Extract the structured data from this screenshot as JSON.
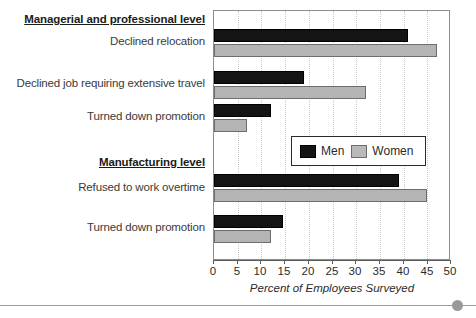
{
  "chart_data": {
    "type": "bar",
    "orientation": "horizontal",
    "title": "",
    "xlabel": "Percent of Employees Surveyed",
    "ylabel": "",
    "xlim": [
      0,
      50
    ],
    "xticks": [
      "0",
      "5",
      "10",
      "15",
      "20",
      "25",
      "30",
      "35",
      "40",
      "45",
      "50"
    ],
    "grid": true,
    "legend_position": "middle-right",
    "groups": [
      {
        "heading": "Managerial and professional level",
        "categories": [
          "Declined relocation",
          "Declined job requiring extensive travel",
          "Turned down promotion"
        ],
        "men": [
          41,
          19,
          12
        ],
        "women": [
          47,
          32,
          7
        ]
      },
      {
        "heading": "Manufacturing level",
        "categories": [
          "Refused to work overtime",
          "Turned down promotion"
        ],
        "men": [
          39,
          14.5
        ],
        "women": [
          45,
          12
        ]
      }
    ],
    "series": [
      {
        "name": "Men",
        "color": "#141414",
        "values": [
          41,
          19,
          12,
          39,
          14.5
        ]
      },
      {
        "name": "Women",
        "color": "#b4b4b4",
        "values": [
          47,
          32,
          7,
          45,
          12
        ]
      }
    ],
    "categories": [
      "Declined relocation",
      "Declined job requiring extensive travel",
      "Turned down promotion",
      "Refused to work overtime",
      "Turned down promotion"
    ]
  },
  "legend": {
    "men_label": "Men",
    "women_label": "Women"
  },
  "axis": {
    "title": "Percent of Employees Surveyed"
  }
}
